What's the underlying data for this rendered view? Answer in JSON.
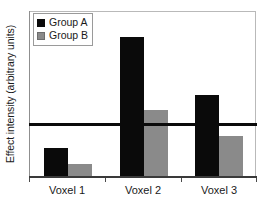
{
  "chart_data": {
    "type": "bar",
    "title": "",
    "xlabel": "",
    "ylabel": "Effect intensity (arbitrary units)",
    "categories": [
      "Voxel 1",
      "Voxel 2",
      "Voxel 3"
    ],
    "series": [
      {
        "name": "Group A",
        "color": "#0a0a0a",
        "values": [
          17,
          84,
          49
        ]
      },
      {
        "name": "Group B",
        "color": "#8a8a8a",
        "values": [
          7,
          40,
          24
        ]
      }
    ],
    "ylim": [
      0,
      100
    ],
    "yticks": [],
    "grid": false,
    "legend_position": "top-left",
    "annotations": [
      {
        "type": "threshold-line",
        "name": "statistical-threshold",
        "value": 32,
        "color": "#0a0a0a"
      }
    ]
  },
  "legend": {
    "items": [
      {
        "label": "Group A",
        "swatch": "black-square-swatch"
      },
      {
        "label": "Group B",
        "swatch": "gray-square-swatch"
      }
    ]
  },
  "axes": {
    "y_title": "Effect intensity (arbitrary units)",
    "x_categories": [
      "Voxel 1",
      "Voxel 2",
      "Voxel 3"
    ]
  }
}
